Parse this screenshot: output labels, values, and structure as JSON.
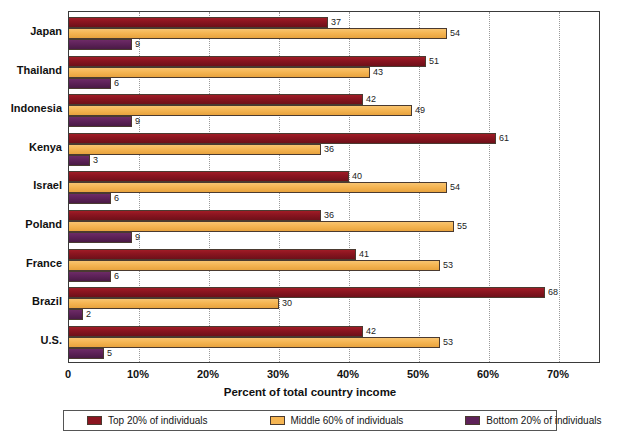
{
  "chart_data": {
    "type": "bar",
    "orientation": "horizontal",
    "title": "",
    "xlabel": "Percent of total country income",
    "ylabel": "",
    "xlim": [
      0,
      76
    ],
    "xticks": [
      0,
      10,
      20,
      30,
      40,
      50,
      60,
      70
    ],
    "xtick_labels": [
      "0",
      "10%",
      "20%",
      "30%",
      "40%",
      "50%",
      "60%",
      "70%"
    ],
    "grid": "vertical-dotted",
    "legend_position": "bottom",
    "categories": [
      "Japan",
      "Thailand",
      "Indonesia",
      "Kenya",
      "Israel",
      "Poland",
      "France",
      "Brazil",
      "U.S."
    ],
    "series": [
      {
        "name": "Top 20% of individuals",
        "color": "#8b1520",
        "values": [
          37,
          51,
          42,
          61,
          40,
          36,
          41,
          68,
          42
        ]
      },
      {
        "name": "Middle 60% of individuals",
        "color": "#f5b553",
        "values": [
          54,
          43,
          49,
          36,
          54,
          55,
          53,
          30,
          53
        ]
      },
      {
        "name": "Bottom 20% of individuals",
        "color": "#5e2259",
        "values": [
          9,
          6,
          9,
          3,
          6,
          9,
          6,
          2,
          5
        ]
      }
    ],
    "value_labels": {
      "Japan": {
        "top": "37",
        "middle": "54",
        "bottom": "9"
      },
      "Thailand": {
        "top": "51",
        "middle": "43",
        "bottom": "6"
      },
      "Indonesia": {
        "top": "42",
        "middle": "49",
        "bottom": "9"
      },
      "Kenya": {
        "top": "61",
        "middle": "36",
        "bottom": "3"
      },
      "Israel": {
        "top": "40",
        "middle": "54",
        "bottom": "6"
      },
      "Poland": {
        "top": "36",
        "middle": "55",
        "bottom": "9"
      },
      "France": {
        "top": "41",
        "middle": "53",
        "bottom": "6"
      },
      "Brazil": {
        "top": "68",
        "middle": "30",
        "bottom": "2"
      },
      "U.S.": {
        "top": "42",
        "middle": "53",
        "bottom": "5"
      }
    }
  },
  "legend": {
    "items": [
      {
        "label": "Top 20% of individuals",
        "color": "#8b1520"
      },
      {
        "label": "Middle 60% of individuals",
        "color": "#f5b553"
      },
      {
        "label": "Bottom 20% of individuals",
        "color": "#5e2259"
      }
    ]
  }
}
